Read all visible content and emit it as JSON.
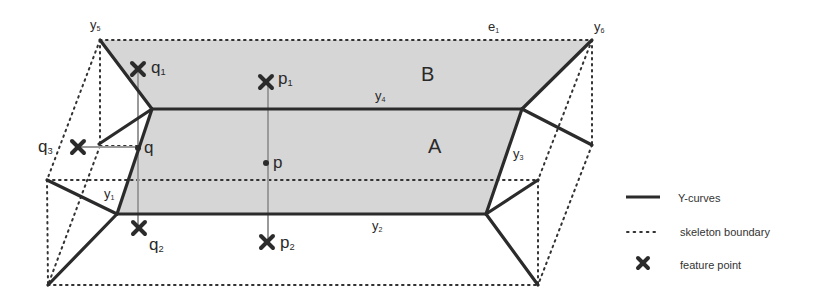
{
  "figure": {
    "regions": [
      {
        "id": "A",
        "label": "A"
      },
      {
        "id": "B",
        "label": "B"
      }
    ],
    "curve_labels": {
      "y1": {
        "base": "y",
        "sub": "1"
      },
      "y2": {
        "base": "y",
        "sub": "2"
      },
      "y3": {
        "base": "y",
        "sub": "3"
      },
      "y4": {
        "base": "y",
        "sub": "4"
      },
      "y5": {
        "base": "y",
        "sub": "5"
      },
      "y6": {
        "base": "y",
        "sub": "6"
      },
      "e1": {
        "base": "e",
        "sub": "1"
      }
    },
    "points": {
      "p": {
        "base": "p",
        "sub": ""
      },
      "p1": {
        "base": "p",
        "sub": "1"
      },
      "p2": {
        "base": "p",
        "sub": "2"
      },
      "q": {
        "base": "q",
        "sub": ""
      },
      "q1": {
        "base": "q",
        "sub": "1"
      },
      "q2": {
        "base": "q",
        "sub": "2"
      },
      "q3": {
        "base": "q",
        "sub": "3"
      }
    },
    "colors": {
      "shade": "#d6d6d6",
      "ycurve": "#2b2b2b",
      "dotted": "#333333",
      "projection": "#9a9a9a"
    }
  },
  "legend": {
    "items": [
      {
        "symbol": "solid-line",
        "label": "Y-curves"
      },
      {
        "symbol": "dotted-line",
        "label": "skeleton boundary"
      },
      {
        "symbol": "cross",
        "label": "feature point"
      }
    ]
  }
}
